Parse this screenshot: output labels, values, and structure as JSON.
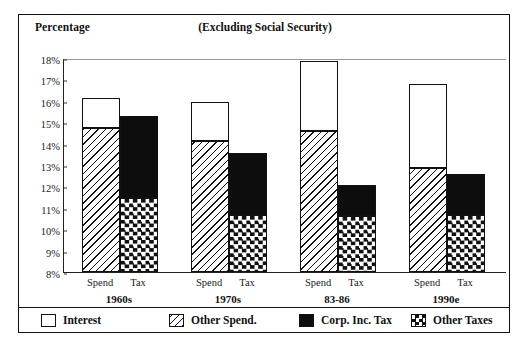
{
  "chart_data": {
    "type": "bar",
    "title": "(Excluding Social Security)",
    "ylabel": "Percentage",
    "xlabel": "",
    "ylim": [
      8,
      18
    ],
    "ytick_labels": [
      "18%",
      "17%",
      "16%",
      "15%",
      "14%",
      "13%",
      "12%",
      "11%",
      "10%",
      "9%",
      "8%"
    ],
    "ytick_values": [
      18,
      17,
      16,
      15,
      14,
      13,
      12,
      11,
      10,
      9,
      8
    ],
    "grid": false,
    "stacked": true,
    "legend_position": "bottom",
    "categories": [
      "1960s",
      "1970s",
      "83-86",
      "1990e"
    ],
    "subcategories": [
      "Spend",
      "Tax"
    ],
    "legend": [
      "Interest",
      "Other Spend.",
      "Corp. Inc. Tax",
      "Other Taxes"
    ],
    "groups": [
      {
        "label": "1960s",
        "bars": [
          {
            "label": "Spend",
            "total": 16.15,
            "segments": [
              {
                "name": "Other Spend.",
                "from": 8,
                "to": 14.75
              },
              {
                "name": "Interest",
                "from": 14.75,
                "to": 16.15
              }
            ]
          },
          {
            "label": "Tax",
            "total": 15.3,
            "segments": [
              {
                "name": "Other Taxes",
                "from": 8,
                "to": 11.45
              },
              {
                "name": "Corp. Inc. Tax",
                "from": 11.45,
                "to": 15.3
              }
            ]
          }
        ]
      },
      {
        "label": "1970s",
        "bars": [
          {
            "label": "Spend",
            "total": 15.95,
            "segments": [
              {
                "name": "Other Spend.",
                "from": 8,
                "to": 14.1
              },
              {
                "name": "Interest",
                "from": 14.1,
                "to": 15.95
              }
            ]
          },
          {
            "label": "Tax",
            "total": 13.55,
            "segments": [
              {
                "name": "Other Taxes",
                "from": 8,
                "to": 10.65
              },
              {
                "name": "Corp. Inc. Tax",
                "from": 10.65,
                "to": 13.55
              }
            ]
          }
        ]
      },
      {
        "label": "83-86",
        "bars": [
          {
            "label": "Spend",
            "total": 17.85,
            "segments": [
              {
                "name": "Other Spend.",
                "from": 8,
                "to": 14.6
              },
              {
                "name": "Interest",
                "from": 14.6,
                "to": 17.85
              }
            ]
          },
          {
            "label": "Tax",
            "total": 12.05,
            "segments": [
              {
                "name": "Other Taxes",
                "from": 8,
                "to": 10.6
              },
              {
                "name": "Corp. Inc. Tax",
                "from": 10.6,
                "to": 12.05
              }
            ]
          }
        ]
      },
      {
        "label": "1990e",
        "bars": [
          {
            "label": "Spend",
            "total": 16.8,
            "segments": [
              {
                "name": "Other Spend.",
                "from": 8,
                "to": 12.85
              },
              {
                "name": "Interest",
                "from": 12.85,
                "to": 16.8
              }
            ]
          },
          {
            "label": "Tax",
            "total": 12.6,
            "segments": [
              {
                "name": "Other Taxes",
                "from": 8,
                "to": 10.65
              },
              {
                "name": "Corp. Inc. Tax",
                "from": 10.65,
                "to": 12.6
              }
            ]
          }
        ]
      }
    ]
  },
  "legend_items": [
    {
      "label": "Interest",
      "swatch": "white"
    },
    {
      "label": "Other Spend.",
      "swatch": "hatch"
    },
    {
      "label": "Corp. Inc. Tax",
      "swatch": "black"
    },
    {
      "label": "Other Taxes",
      "swatch": "check"
    }
  ],
  "colors": {
    "ink": "#111111",
    "background": "#ffffff",
    "black_fill": "#0d0d0d"
  }
}
